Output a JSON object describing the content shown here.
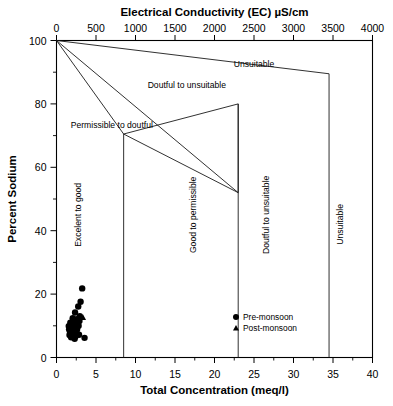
{
  "chart_data": {
    "type": "scatter",
    "title": "",
    "xlabel": "Total Concentration (meq/l)",
    "ylabel": "Percent Sodium",
    "x2label": "Electrical Conductivity (EC) µS/cm",
    "xlim": [
      0,
      40
    ],
    "ylim": [
      0,
      100
    ],
    "x2lim": [
      0,
      4000
    ],
    "grid": false,
    "legend_position": "inside-bottom-right",
    "xticks": [
      0,
      5,
      10,
      15,
      20,
      25,
      30,
      35,
      40
    ],
    "xticklabels": [
      "0",
      "5",
      "10",
      "15",
      "20",
      "25",
      "30",
      "35",
      "40"
    ],
    "yticks": [
      0,
      20,
      40,
      60,
      80,
      100
    ],
    "yticklabels": [
      "0",
      "20",
      "40",
      "60",
      "80",
      "100"
    ],
    "yticks_minor": [
      10,
      30,
      50,
      70,
      90
    ],
    "x2ticks": [
      0,
      500,
      1000,
      1500,
      2000,
      2500,
      3000,
      3500,
      4000
    ],
    "x2ticklabels": [
      "0",
      "500",
      "1000",
      "1500",
      "2000",
      "2500",
      "3000",
      "3500",
      "4000"
    ],
    "annotations": [
      {
        "text": "Unsuitable",
        "x": 25.0,
        "y": 91.5,
        "rotation": 0,
        "name": "zone-unsuitable-upper"
      },
      {
        "text": "Doutful to unsuitable",
        "x": 16.5,
        "y": 85.0,
        "rotation": 0,
        "name": "zone-doutful-to-unsuitable-upper"
      },
      {
        "text": "Permissible to doutful",
        "x": 7.0,
        "y": 72.5,
        "rotation": 0,
        "name": "zone-permissible-to-doutful"
      },
      {
        "text": "Excelent to good",
        "x": 3.1,
        "y": 45.0,
        "rotation": -90,
        "name": "zone-excelent-to-good"
      },
      {
        "text": "Good to permissible",
        "x": 17.6,
        "y": 45.0,
        "rotation": -90,
        "name": "zone-good-to-permissible"
      },
      {
        "text": "Doutful to unsuitable",
        "x": 26.9,
        "y": 45.0,
        "rotation": -90,
        "name": "zone-doutful-to-unsuitable-side"
      },
      {
        "text": "Unsuitable",
        "x": 36.3,
        "y": 42.0,
        "rotation": -90,
        "name": "zone-unsuitable-side"
      }
    ],
    "boundaries": [
      {
        "name": "excelent-to-good-upper-diagonal",
        "points": [
          [
            0,
            100
          ],
          [
            8.5,
            70.5
          ]
        ]
      },
      {
        "name": "good-to-permissible-diagonal",
        "points": [
          [
            0,
            100
          ],
          [
            23.0,
            52.0
          ]
        ]
      },
      {
        "name": "doutful-to-unsuitable-diagonal",
        "points": [
          [
            0,
            100
          ],
          [
            34.5,
            89.5
          ]
        ]
      },
      {
        "name": "permissible-to-doutful-diagonal",
        "points": [
          [
            8.5,
            70.5
          ],
          [
            23.0,
            52.0
          ]
        ]
      },
      {
        "name": "divider-8.5",
        "points": [
          [
            8.5,
            70.5
          ],
          [
            8.5,
            0
          ]
        ]
      },
      {
        "name": "divider-23",
        "points": [
          [
            23.0,
            80.0
          ],
          [
            23.0,
            0
          ]
        ]
      },
      {
        "name": "divider-23-upper",
        "points": [
          [
            23.0,
            80.0
          ],
          [
            23.0,
            52.0
          ]
        ]
      },
      {
        "name": "divider-34.5",
        "points": [
          [
            34.5,
            89.5
          ],
          [
            34.5,
            0
          ]
        ]
      },
      {
        "name": "permissible-ceiling",
        "points": [
          [
            8.5,
            70.5
          ],
          [
            23.0,
            80.0
          ]
        ]
      }
    ],
    "series": [
      {
        "name": "Pre-monsoon",
        "marker": "circle",
        "color": "#000000",
        "points": [
          [
            3.25,
            21.8
          ],
          [
            3.05,
            17.6
          ],
          [
            2.75,
            16.1
          ],
          [
            2.35,
            14.2
          ],
          [
            2.95,
            13.0
          ],
          [
            2.6,
            12.1
          ],
          [
            2.25,
            11.8
          ],
          [
            2.05,
            11.2
          ],
          [
            1.9,
            10.6
          ],
          [
            2.45,
            10.4
          ],
          [
            2.8,
            10.0
          ],
          [
            2.15,
            9.7
          ],
          [
            1.8,
            9.4
          ],
          [
            2.35,
            9.1
          ],
          [
            2.6,
            8.8
          ],
          [
            2.0,
            8.5
          ],
          [
            1.7,
            8.2
          ],
          [
            2.25,
            7.9
          ],
          [
            2.5,
            7.6
          ],
          [
            1.95,
            7.4
          ],
          [
            1.65,
            7.1
          ],
          [
            2.15,
            6.9
          ],
          [
            2.4,
            6.6
          ],
          [
            1.85,
            6.4
          ],
          [
            2.7,
            9.9
          ],
          [
            2.05,
            12.4
          ],
          [
            1.75,
            11.0
          ],
          [
            2.9,
            11.5
          ],
          [
            2.3,
            5.9
          ],
          [
            1.6,
            8.9
          ],
          [
            2.55,
            10.9
          ],
          [
            2.1,
            10.1
          ],
          [
            3.55,
            6.2
          ],
          [
            2.85,
            7.2
          ],
          [
            1.55,
            9.9
          ],
          [
            2.45,
            8.3
          ]
        ]
      },
      {
        "name": "Post-monsoon",
        "marker": "triangle",
        "color": "#000000",
        "points": [
          [
            3.35,
            12.6
          ],
          [
            2.2,
            9.2
          ],
          [
            2.65,
            8.0
          ],
          [
            1.95,
            10.8
          ]
        ]
      }
    ]
  },
  "legend": {
    "entries": [
      {
        "label": "Pre-monsoon",
        "marker": "circle"
      },
      {
        "label": "Post-monsoon",
        "marker": "triangle"
      }
    ]
  }
}
